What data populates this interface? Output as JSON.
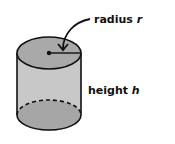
{
  "diagram": {
    "labels": {
      "radius": {
        "text": "radius ",
        "variable": "r"
      },
      "height": {
        "text": "height ",
        "variable": "h"
      }
    },
    "colors": {
      "top_face": "#a9a9a9",
      "side": "#c8c8c8",
      "bottom_face": "#a6a6a6",
      "stroke": "#111111",
      "background": "#ffffff"
    }
  }
}
